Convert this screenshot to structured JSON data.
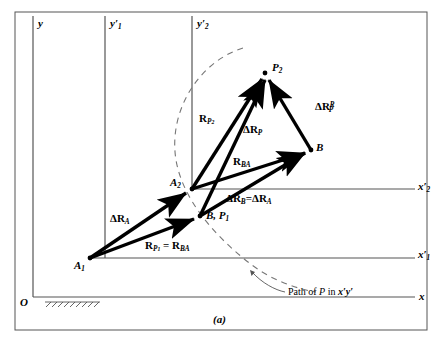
{
  "figure": {
    "caption": "(a)",
    "origin_label": "O",
    "path_note": "Path of P in x'y'"
  },
  "axes": [
    {
      "name": "y-axis",
      "label": "y",
      "label_main": "y",
      "sub": "",
      "prime": false
    },
    {
      "name": "y1-axis",
      "label": "y'1",
      "label_main": "y",
      "sub": "1",
      "prime": true
    },
    {
      "name": "y2-axis",
      "label": "y'2",
      "label_main": "y",
      "sub": "2",
      "prime": true
    },
    {
      "name": "x-axis",
      "label": "x",
      "label_main": "x",
      "sub": "",
      "prime": false
    },
    {
      "name": "x1-axis",
      "label": "x'1",
      "label_main": "x",
      "sub": "1",
      "prime": true
    },
    {
      "name": "x2-axis",
      "label": "x'2",
      "label_main": "x",
      "sub": "2",
      "prime": true
    }
  ],
  "points": [
    {
      "id": "A1",
      "main": "A",
      "sub": "1",
      "x": 90,
      "y": 258
    },
    {
      "id": "A2",
      "main": "A",
      "sub": "2",
      "x": 192,
      "y": 189
    },
    {
      "id": "B",
      "main": "B",
      "sub": "",
      "x": 311,
      "y": 150
    },
    {
      "id": "P2",
      "main": "P",
      "sub": "2",
      "x": 265,
      "y": 73
    },
    {
      "id": "BP1",
      "main": "B, P",
      "sub": "1",
      "x": 200,
      "y": 216
    }
  ],
  "vectors": [
    {
      "id": "dRA",
      "main": "ΔR",
      "sub": "A",
      "sup": "",
      "label": "ΔR_A",
      "from": "A1",
      "to": "A2"
    },
    {
      "id": "RP1",
      "main": "R",
      "sub": "P1",
      "sup": "",
      "label": "R_P1 = R_BA",
      "from": "A1",
      "to": "BP1"
    },
    {
      "id": "dRB",
      "main": "ΔR",
      "sub": "B",
      "sup": "",
      "label": "ΔR_B = ΔR_A",
      "from": "BP1",
      "to": "B"
    },
    {
      "id": "RBA",
      "main": "R",
      "sub": "BA",
      "sup": "",
      "label": "R_BA",
      "from": "A2",
      "to": "B"
    },
    {
      "id": "RP2",
      "main": "R",
      "sub": "P2",
      "sup": "",
      "label": "R_P2",
      "from": "A2",
      "to": "P2"
    },
    {
      "id": "dRP",
      "main": "ΔR",
      "sub": "P",
      "sup": "",
      "label": "ΔR_P",
      "from": "BP1",
      "to": "P2"
    },
    {
      "id": "dRPR",
      "main": "ΔR",
      "sub": "P",
      "sup": "R",
      "label": "ΔR_P^R",
      "from": "B",
      "to": "P2"
    }
  ],
  "labels": {
    "y": "y",
    "y1_main": "y",
    "y1_sub": "1",
    "y2_main": "y",
    "y2_sub": "2",
    "x": "x",
    "x1_main": "x",
    "x1_sub": "1",
    "x2_main": "x",
    "x2_sub": "2",
    "prime": "′",
    "A1_main": "A",
    "A1_sub": "1",
    "A2_main": "A",
    "A2_sub": "2",
    "B": "B",
    "P2_main": "P",
    "P2_sub": "2",
    "BP1_main": "B, P",
    "BP1_sub": "1",
    "delta": "Δ",
    "R": "R",
    "eq": "=",
    "dRA_sub": "A",
    "RP1_sub": "P",
    "RP1_subnum": "1",
    "RBA_sub": "BA",
    "dRB_sub": "B",
    "RP2_sub": "P",
    "RP2_subnum": "2",
    "dRP_sub": "P",
    "dRPR_sub": "P",
    "dRPR_sup": "R",
    "path_text": "Path of",
    "path_P": "P",
    "path_in": "in",
    "path_frame": "x′y′",
    "origin": "O",
    "caption": "(a)"
  }
}
